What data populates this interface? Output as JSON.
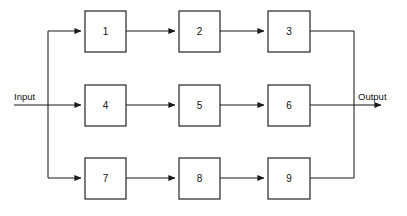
{
  "diagram": {
    "type": "reliability-block-diagram",
    "title": "",
    "canvas": {
      "width": 407,
      "height": 216,
      "background": "#ffffff"
    },
    "stroke_color": "#1a1a1a",
    "block_fill": "#ffffff",
    "input": {
      "label": "Input",
      "x": 14,
      "y": 97
    },
    "output": {
      "label": "Output",
      "x": 358,
      "y": 97
    },
    "blocks": [
      {
        "id": "b1",
        "label": "1",
        "x": 85,
        "y": 11,
        "w": 41,
        "h": 41,
        "row": 0,
        "col": 0
      },
      {
        "id": "b2",
        "label": "2",
        "x": 179,
        "y": 11,
        "w": 41,
        "h": 41,
        "row": 0,
        "col": 1
      },
      {
        "id": "b3",
        "label": "3",
        "x": 268,
        "y": 11,
        "w": 42,
        "h": 41,
        "row": 0,
        "col": 2
      },
      {
        "id": "b4",
        "label": "4",
        "x": 85,
        "y": 85,
        "w": 41,
        "h": 41,
        "row": 1,
        "col": 0
      },
      {
        "id": "b5",
        "label": "5",
        "x": 179,
        "y": 85,
        "w": 41,
        "h": 41,
        "row": 1,
        "col": 1
      },
      {
        "id": "b6",
        "label": "6",
        "x": 268,
        "y": 85,
        "w": 42,
        "h": 41,
        "row": 1,
        "col": 2
      },
      {
        "id": "b7",
        "label": "7",
        "x": 85,
        "y": 158,
        "w": 41,
        "h": 41,
        "row": 2,
        "col": 0
      },
      {
        "id": "b8",
        "label": "8",
        "x": 179,
        "y": 158,
        "w": 41,
        "h": 41,
        "row": 2,
        "col": 1
      },
      {
        "id": "b9",
        "label": "9",
        "x": 268,
        "y": 158,
        "w": 42,
        "h": 41,
        "row": 2,
        "col": 2
      }
    ],
    "rows": [
      {
        "index": 0,
        "center_y": 31,
        "blocks": [
          "1",
          "2",
          "3"
        ]
      },
      {
        "index": 1,
        "center_y": 105,
        "blocks": [
          "4",
          "5",
          "6"
        ]
      },
      {
        "index": 2,
        "center_y": 178,
        "blocks": [
          "7",
          "8",
          "9"
        ]
      }
    ],
    "bus": {
      "left_x": 48,
      "right_x": 354,
      "top_y": 31,
      "bottom_y": 178
    },
    "connections": [
      {
        "from": "input",
        "to": "bus-left"
      },
      {
        "from": "bus-left",
        "to": "1",
        "arrow": true
      },
      {
        "from": "bus-left",
        "to": "4",
        "arrow": true
      },
      {
        "from": "bus-left",
        "to": "7",
        "arrow": true
      },
      {
        "from": "1",
        "to": "2",
        "arrow": true
      },
      {
        "from": "2",
        "to": "3",
        "arrow": true
      },
      {
        "from": "4",
        "to": "5",
        "arrow": true
      },
      {
        "from": "5",
        "to": "6",
        "arrow": true
      },
      {
        "from": "7",
        "to": "8",
        "arrow": true
      },
      {
        "from": "8",
        "to": "9",
        "arrow": true
      },
      {
        "from": "3",
        "to": "bus-right"
      },
      {
        "from": "6",
        "to": "bus-right"
      },
      {
        "from": "9",
        "to": "bus-right"
      },
      {
        "from": "bus-right",
        "to": "output",
        "arrow": true
      }
    ]
  }
}
